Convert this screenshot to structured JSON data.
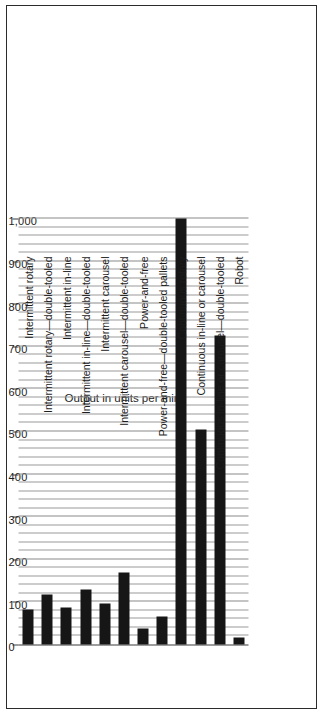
{
  "chart_data": {
    "type": "bar",
    "title": "",
    "subtitle": "",
    "orientation": "vertical-rotated",
    "xlabel": "",
    "ylabel": "Output in units per min",
    "ylim": [
      0,
      1000
    ],
    "ytick_labels": [
      "0",
      "100",
      "200",
      "300",
      "400",
      "500",
      "600",
      "700",
      "800",
      "900",
      "1,000"
    ],
    "ytick_values": [
      0,
      100,
      200,
      300,
      400,
      500,
      600,
      700,
      800,
      900,
      1000
    ],
    "grid": true,
    "grid_interval": 20,
    "legend": "none",
    "bar_color": "#161616",
    "categories": [
      "Intermittent rotary",
      "Intermittent rotary—double-tooled",
      "Intermittent in-line",
      "Intermittent in-line—double-tooled",
      "Intermittent carousel",
      "Intermittent carousel—double-tooled",
      "Power-and-free",
      "Power-and-free—double-tooled pallets",
      "Continuous rotary",
      "Continuous in-line or carousel",
      "Continuous in-line or carousel—double-tooled",
      "Robot"
    ],
    "values": [
      83,
      118,
      87,
      130,
      97,
      170,
      37,
      65,
      1000,
      505,
      725,
      17
    ]
  },
  "axis": {
    "value_axis_title": "Output in units per min"
  }
}
